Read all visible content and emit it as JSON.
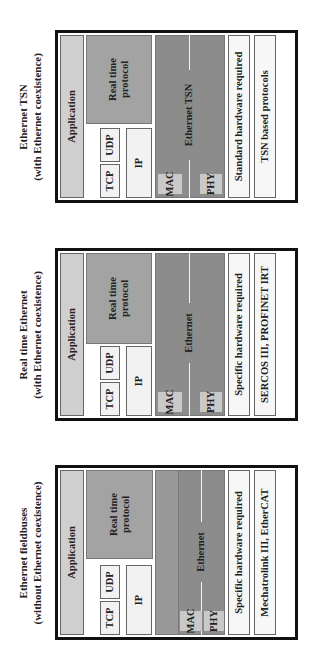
{
  "panels": [
    {
      "title": [
        "Ethernet TSN",
        "(with Ethernet coexistence)"
      ],
      "application": "Application",
      "realtime_protocol": [
        "Real time",
        "protocol"
      ],
      "tcp": "TCP",
      "udp": "UDP",
      "ip": "IP",
      "mac": "MAC",
      "phy": "PHY",
      "link_layer": "Ethernet TSN",
      "hardware": "Standard hardware required",
      "examples": "TSN based protocols"
    },
    {
      "title": [
        "Real time Ethernet",
        "(with Ethernet coexistence)"
      ],
      "application": "Application",
      "realtime_protocol": [
        "Real time",
        "protocol"
      ],
      "tcp": "TCP",
      "udp": "UDP",
      "ip": "IP",
      "mac": "MAC",
      "phy": "PHY",
      "link_layer": "Ethernet",
      "hardware": "Specific hardware required",
      "examples": "SERCOS III, PROFINET IRT"
    },
    {
      "title": [
        "Ethernet fieldbuses",
        "(without Ethernet coexistence)"
      ],
      "application": "Application",
      "realtime_protocol": [
        "Real time",
        "protocol"
      ],
      "tcp": "TCP",
      "udp": "UDP",
      "ip": "IP",
      "mac": "MAC",
      "phy": "PHY",
      "link_layer": "Ethernet",
      "hardware": "Specific hardware required",
      "examples": "Mechatrolink III, EtherCAT"
    }
  ]
}
